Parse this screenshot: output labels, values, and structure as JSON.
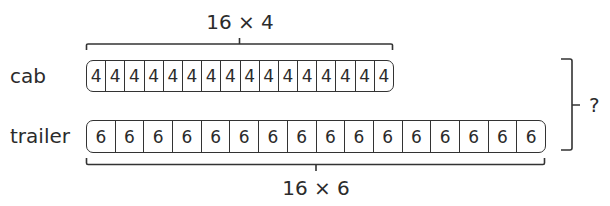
{
  "rows": [
    {
      "label": "cab",
      "cell_value": "4",
      "cell_count": 16,
      "brace_label": "16 × 4",
      "brace_position": "top"
    },
    {
      "label": "trailer",
      "cell_value": "6",
      "cell_count": 16,
      "brace_label": "16 × 6",
      "brace_position": "bottom"
    }
  ],
  "total": {
    "label": "?"
  },
  "colors": {
    "stroke": "#333333",
    "text": "#2b2b2b",
    "background": "#ffffff"
  }
}
